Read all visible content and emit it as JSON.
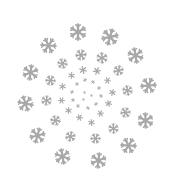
{
  "image": {
    "description": "Spiral arrangement of gray snowflakes on white background",
    "background": "#ffffff",
    "flake_color": "#a8a8a8",
    "flake_icon": "snowflake-icon"
  },
  "flakes": [
    {
      "x": 78,
      "y": 32,
      "s": 18
    },
    {
      "x": 110,
      "y": 37,
      "s": 18
    },
    {
      "x": 48,
      "y": 45,
      "s": 17
    },
    {
      "x": 135,
      "y": 55,
      "s": 17
    },
    {
      "x": 30,
      "y": 72,
      "s": 17
    },
    {
      "x": 148,
      "y": 85,
      "s": 17
    },
    {
      "x": 25,
      "y": 103,
      "s": 17
    },
    {
      "x": 145,
      "y": 120,
      "s": 17
    },
    {
      "x": 37,
      "y": 135,
      "s": 17
    },
    {
      "x": 128,
      "y": 145,
      "s": 17
    },
    {
      "x": 62,
      "y": 156,
      "s": 17
    },
    {
      "x": 98,
      "y": 160,
      "s": 17
    },
    {
      "x": 81,
      "y": 55,
      "s": 12
    },
    {
      "x": 62,
      "y": 63,
      "s": 11
    },
    {
      "x": 102,
      "y": 58,
      "s": 12
    },
    {
      "x": 118,
      "y": 70,
      "s": 11
    },
    {
      "x": 50,
      "y": 80,
      "s": 11
    },
    {
      "x": 127,
      "y": 90,
      "s": 11
    },
    {
      "x": 46,
      "y": 100,
      "s": 11
    },
    {
      "x": 125,
      "y": 112,
      "s": 11
    },
    {
      "x": 55,
      "y": 120,
      "s": 11
    },
    {
      "x": 113,
      "y": 128,
      "s": 11
    },
    {
      "x": 70,
      "y": 136,
      "s": 11
    },
    {
      "x": 95,
      "y": 138,
      "s": 11
    },
    {
      "x": 83,
      "y": 70,
      "s": 8
    },
    {
      "x": 71,
      "y": 75,
      "s": 7
    },
    {
      "x": 97,
      "y": 71,
      "s": 8
    },
    {
      "x": 107,
      "y": 80,
      "s": 7
    },
    {
      "x": 62,
      "y": 86,
      "s": 7
    },
    {
      "x": 112,
      "y": 92,
      "s": 7
    },
    {
      "x": 61,
      "y": 100,
      "s": 7
    },
    {
      "x": 108,
      "y": 103,
      "s": 7
    },
    {
      "x": 68,
      "y": 110,
      "s": 7
    },
    {
      "x": 100,
      "y": 113,
      "s": 7
    },
    {
      "x": 79,
      "y": 117,
      "s": 7
    },
    {
      "x": 91,
      "y": 122,
      "s": 7
    },
    {
      "x": 85,
      "y": 80,
      "s": 4
    },
    {
      "x": 77,
      "y": 84,
      "s": 4
    },
    {
      "x": 93,
      "y": 82,
      "s": 4
    },
    {
      "x": 99,
      "y": 88,
      "s": 4
    },
    {
      "x": 72,
      "y": 92,
      "s": 4
    },
    {
      "x": 101,
      "y": 96,
      "s": 4
    },
    {
      "x": 73,
      "y": 100,
      "s": 4
    },
    {
      "x": 96,
      "y": 104,
      "s": 4
    },
    {
      "x": 78,
      "y": 106,
      "s": 4
    },
    {
      "x": 88,
      "y": 108,
      "s": 4
    },
    {
      "x": 84,
      "y": 92,
      "s": 3
    },
    {
      "x": 91,
      "y": 95,
      "s": 3
    },
    {
      "x": 83,
      "y": 99,
      "s": 3
    }
  ]
}
